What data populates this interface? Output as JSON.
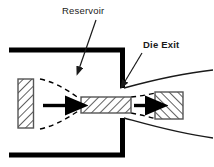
{
  "figure": {
    "width": 214,
    "height": 167,
    "background": "#ffffff"
  },
  "colors": {
    "line": "#000000",
    "text": "#1a1a1a",
    "wall": "#000000",
    "hatch": "#333333",
    "dashed": "#000000",
    "background": "#ffffff"
  },
  "labels": {
    "reservoir": "Reservoir",
    "die_exit": "Die Exit"
  },
  "annotations": [
    {
      "name": "reservoir-label",
      "text": "Reservoir",
      "text_x": 62,
      "text_y": 14,
      "leader_from_x": 96,
      "leader_from_y": 20,
      "leader_to_x": 78,
      "leader_to_y": 72
    },
    {
      "name": "die-exit-label",
      "text": "Die Exit",
      "text_x": 143,
      "text_y": 48,
      "leader_from_x": 142,
      "leader_from_y": 53,
      "leader_to_x": 122,
      "leader_to_y": 85
    }
  ],
  "parts": {
    "top_wall": {
      "name": "reservoir-top-wall",
      "x1": 9,
      "y1": 50,
      "x2": 120,
      "y2": 50,
      "thickness": 5
    },
    "top_wall_vertical": {
      "name": "die-wall-upper",
      "x1": 120,
      "y1": 50,
      "x2": 120,
      "y2": 90,
      "thickness": 5
    },
    "bottom_wall": {
      "name": "reservoir-bottom-wall",
      "x1": 9,
      "y1": 155,
      "x2": 120,
      "y2": 155,
      "thickness": 5
    },
    "bottom_wall_vertical": {
      "name": "die-wall-lower",
      "x1": 120,
      "y1": 115,
      "x2": 120,
      "y2": 155,
      "thickness": 5
    },
    "piston": {
      "name": "piston-block",
      "x": 18,
      "y": 80,
      "width": 15,
      "height": 48,
      "hatch": "backslash"
    },
    "die_land": {
      "name": "die-land-material",
      "x": 81,
      "y": 97,
      "width": 50,
      "height": 16,
      "hatch": "backslash"
    },
    "extrudate": {
      "name": "extrudate-block",
      "x": 155,
      "y": 93,
      "width": 28,
      "height": 26,
      "hatch": "forwardslash"
    },
    "arrow_left": {
      "name": "flow-arrow-inlet",
      "x1": 43,
      "y1": 106,
      "x2": 72,
      "y2": 106
    },
    "arrow_right": {
      "name": "flow-arrow-outlet",
      "x1": 134,
      "y1": 106,
      "x2": 152,
      "y2": 106
    }
  },
  "flow_lines": {
    "converging_upper": {
      "name": "converging-streamline-upper",
      "style": "dashed"
    },
    "converging_lower": {
      "name": "converging-streamline-lower",
      "style": "dashed"
    },
    "exit_swell_upper": {
      "name": "die-swell-curve-upper",
      "style": "solid"
    },
    "exit_swell_lower": {
      "name": "die-swell-curve-lower",
      "style": "solid"
    },
    "exit_dashed_upper": {
      "name": "exit-streamline-upper",
      "style": "dashed"
    },
    "exit_dashed_lower": {
      "name": "exit-streamline-lower",
      "style": "dashed"
    }
  }
}
